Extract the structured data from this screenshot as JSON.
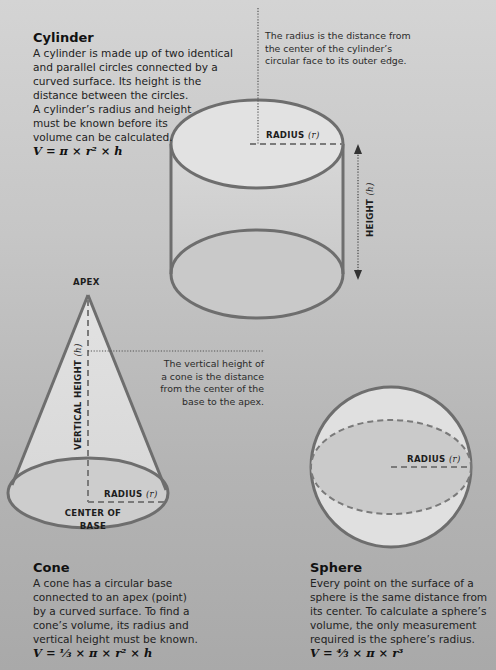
{
  "cylinder": {
    "title": "Cylinder",
    "lines": [
      "A cylinder is made up of two identical",
      "and parallel circles connected by a",
      "curved surface. Its height is the",
      "distance between the circles.",
      "A cylinder’s radius and height",
      "must be known before its",
      "volume can be calculated."
    ],
    "formula": "V = π × r² × h",
    "note_lines": [
      "The radius is the distance from",
      "the center of the cylinder’s",
      "circular face to its outer edge."
    ],
    "radius_label": "RADIUS",
    "radius_var": "(r)",
    "height_label": "HEIGHT",
    "height_var": "(h)"
  },
  "cone": {
    "title": "Cone",
    "lines": [
      "A cone has a circular base",
      "connected to an apex (point)",
      "by a curved surface. To find a",
      "cone’s volume, its radius and",
      "vertical height must be known."
    ],
    "formula": "V = ⅓ × π × r² × h",
    "apex_label": "APEX",
    "vertical_height_label": "VERTICAL HEIGHT",
    "vertical_height_var": "(h)",
    "note_lines": [
      "The vertical height of",
      "a cone is the distance",
      "from the center of the",
      "base to the apex."
    ],
    "radius_label": "RADIUS",
    "radius_var": "(r)",
    "center_label_lines": [
      "CENTER OF",
      "BASE"
    ]
  },
  "sphere": {
    "title": "Sphere",
    "lines": [
      "Every point on the surface of a",
      "sphere is the same distance from",
      "its center. To calculate a sphere’s",
      "volume, the only measurement",
      "required is the sphere’s radius."
    ],
    "formula": "V = ⁴⁄₃ × π × r³",
    "radius_label": "RADIUS",
    "radius_var": "(r)"
  },
  "colors": {
    "outline": "#6e6e6e",
    "face_light": "#e4e4e4",
    "face_mid": "#cfcfcf",
    "dash": "#707070"
  }
}
